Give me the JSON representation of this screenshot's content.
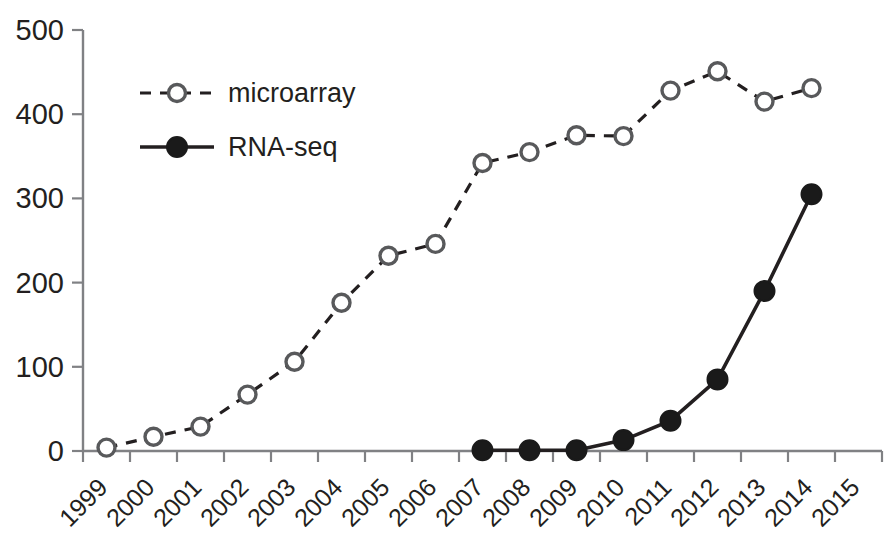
{
  "chart_data": {
    "type": "line",
    "title": "",
    "subtitle": "",
    "xlabel": "",
    "ylabel": "",
    "x": [
      1999,
      2000,
      2001,
      2002,
      2003,
      2004,
      2005,
      2006,
      2007,
      2008,
      2009,
      2010,
      2011,
      2012,
      2013,
      2014
    ],
    "xticklabels": [
      "1999",
      "2000",
      "2001",
      "2002",
      "2003",
      "2004",
      "2005",
      "2006",
      "2007",
      "2008",
      "2009",
      "2010",
      "2011",
      "2012",
      "2013",
      "2014",
      "2015"
    ],
    "yticklabels": [
      "0",
      "100",
      "200",
      "300",
      "400",
      "500"
    ],
    "yticks": [
      0,
      100,
      200,
      300,
      400,
      500
    ],
    "ylim": [
      0,
      500
    ],
    "xlim": [
      1998.5,
      2015.5
    ],
    "grid": false,
    "legend_position": "upper-left",
    "series": [
      {
        "name": "microarray",
        "marker": "open-circle",
        "linestyle": "dashed",
        "color": "#231f20",
        "values": [
          4,
          17,
          29,
          67,
          106,
          176,
          232,
          246,
          342,
          355,
          375,
          374,
          428,
          451,
          415,
          431
        ]
      },
      {
        "name": "RNA-seq",
        "marker": "filled-circle",
        "linestyle": "solid",
        "color": "#1a1a1a",
        "values": [
          null,
          null,
          null,
          null,
          null,
          null,
          null,
          null,
          1,
          1,
          1,
          13,
          36,
          85,
          190,
          305
        ]
      }
    ],
    "legend": [
      {
        "label": "microarray",
        "marker": "open-circle",
        "linestyle": "dashed"
      },
      {
        "label": "RNA-seq",
        "marker": "filled-circle",
        "linestyle": "solid"
      }
    ]
  }
}
